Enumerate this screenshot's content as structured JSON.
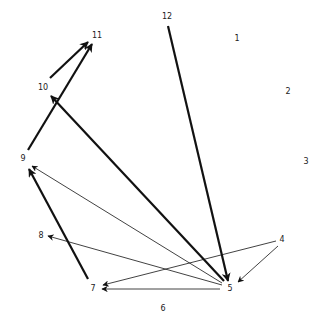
{
  "diagram": {
    "type": "directed-graph",
    "colors": {
      "edge": "#111111",
      "label": "#222222",
      "background": "#ffffff"
    },
    "nodes": [
      {
        "id": "1",
        "label": "1",
        "x": 237,
        "y": 38
      },
      {
        "id": "2",
        "label": "2",
        "x": 288,
        "y": 91
      },
      {
        "id": "3",
        "label": "3",
        "x": 306,
        "y": 161
      },
      {
        "id": "4",
        "label": "4",
        "x": 282,
        "y": 239
      },
      {
        "id": "5",
        "label": "5",
        "x": 230,
        "y": 288
      },
      {
        "id": "6",
        "label": "6",
        "x": 163,
        "y": 308
      },
      {
        "id": "7",
        "label": "7",
        "x": 93,
        "y": 288
      },
      {
        "id": "8",
        "label": "8",
        "x": 41,
        "y": 235
      },
      {
        "id": "9",
        "label": "9",
        "x": 23,
        "y": 158
      },
      {
        "id": "10",
        "label": "10",
        "x": 43,
        "y": 87
      },
      {
        "id": "11",
        "label": "11",
        "x": 97,
        "y": 35
      },
      {
        "id": "12",
        "label": "12",
        "x": 167,
        "y": 16
      }
    ],
    "edges": [
      {
        "from": "10",
        "to": "11",
        "weight": "thick",
        "x1": 50,
        "y1": 78,
        "x2": 88,
        "y2": 42
      },
      {
        "from": "9",
        "to": "11",
        "weight": "thick",
        "x1": 28,
        "y1": 150,
        "x2": 92,
        "y2": 44
      },
      {
        "from": "5",
        "to": "10",
        "weight": "thick",
        "x1": 224,
        "y1": 281,
        "x2": 51,
        "y2": 96
      },
      {
        "from": "12",
        "to": "5",
        "weight": "thick",
        "x1": 168,
        "y1": 26,
        "x2": 228,
        "y2": 281
      },
      {
        "from": "7",
        "to": "9",
        "weight": "thick",
        "x1": 88,
        "y1": 279,
        "x2": 29,
        "y2": 169
      },
      {
        "from": "5",
        "to": "9",
        "weight": "thin",
        "x1": 222,
        "y1": 283,
        "x2": 32,
        "y2": 166
      },
      {
        "from": "5",
        "to": "8",
        "weight": "thin",
        "x1": 222,
        "y1": 285,
        "x2": 48,
        "y2": 236
      },
      {
        "from": "5",
        "to": "7",
        "weight": "thin",
        "x1": 220,
        "y1": 289,
        "x2": 102,
        "y2": 289
      },
      {
        "from": "4",
        "to": "7",
        "weight": "thin",
        "x1": 276,
        "y1": 241,
        "x2": 103,
        "y2": 285
      },
      {
        "from": "4",
        "to": "5",
        "weight": "thin",
        "x1": 278,
        "y1": 246,
        "x2": 238,
        "y2": 282
      }
    ]
  }
}
